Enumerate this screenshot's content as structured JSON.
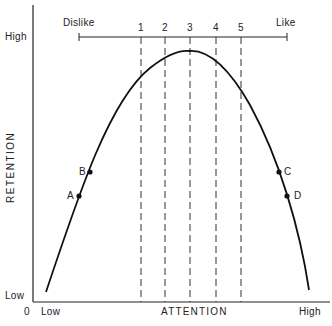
{
  "diagram": {
    "type": "inverted-U curve",
    "x_axis": {
      "label": "ATTENTION",
      "low": "Low",
      "high": "High",
      "origin": "0"
    },
    "y_axis": {
      "label": "RETENTION",
      "low": "Low",
      "high": "High"
    },
    "scale": {
      "left": "Dislike",
      "right": "Like",
      "ticks": [
        "1",
        "2",
        "3",
        "4",
        "5"
      ]
    },
    "points": [
      {
        "label": "A",
        "side": "left"
      },
      {
        "label": "B",
        "side": "left"
      },
      {
        "label": "C",
        "side": "right"
      },
      {
        "label": "D",
        "side": "right"
      }
    ]
  }
}
